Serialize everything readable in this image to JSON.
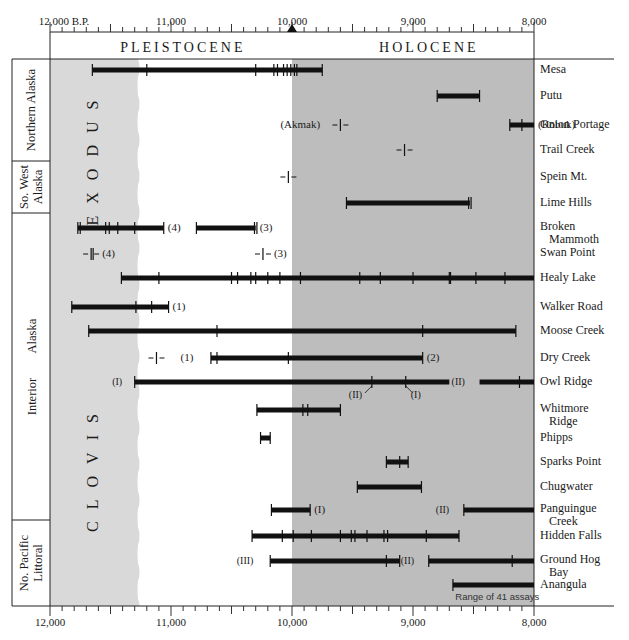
{
  "chart_data": {
    "type": "range-timeline",
    "title": "",
    "x_axis": {
      "label_top_left": "12,000 B.P.",
      "ticks_top": [
        "12,000 B.P.",
        "11,000",
        "10,000",
        "9,000",
        "8,000"
      ],
      "ticks_bottom": [
        "12,000",
        "11,000",
        "10,000",
        "9,000",
        "8,000"
      ],
      "range": [
        12000,
        8000
      ],
      "direction": "decreasing-left-to-right",
      "minor_tick_interval": 100,
      "marker": {
        "value": 10000,
        "symbol": "triangle"
      }
    },
    "epochs": [
      {
        "name": "PLEISTOCENE",
        "from": 12000,
        "to": 10000
      },
      {
        "name": "HOLOCENE",
        "from": 10000,
        "to": 8000
      }
    ],
    "complexes": [
      {
        "name": "EXODUS",
        "zone": "left light-grey band"
      },
      {
        "name": "CLOVIS",
        "zone": "left light-grey band"
      }
    ],
    "regions": [
      {
        "name": "Northern Alaska",
        "sites": [
          "Mesa",
          "Putu",
          "Onion Portage",
          "Trail Creek"
        ]
      },
      {
        "name": "So. West Alaska",
        "sites": [
          "Spein Mt.",
          "Lime Hills"
        ]
      },
      {
        "name": "Interior Alaska",
        "sites": [
          "Broken Mammoth",
          "Swan Point",
          "Healy Lake",
          "Walker Road",
          "Moose Creek",
          "Dry Creek",
          "Owl Ridge",
          "Whitmore Ridge",
          "Phipps",
          "Sparks Point",
          "Chugwater",
          "Panguingue Creek"
        ]
      },
      {
        "name": "No. Pacific Littoral",
        "sites": [
          "Hidden Falls",
          "Ground Hog Bay",
          "Anangula"
        ]
      }
    ],
    "sites": [
      {
        "name": "Mesa",
        "ranges": [
          {
            "from": 11650,
            "to": 9750,
            "dates": [
              11650,
              11200,
              10300,
              10150,
              10120,
              10070,
              10040,
              10010,
              9980,
              9960,
              9750
            ]
          }
        ]
      },
      {
        "name": "Putu",
        "ranges": [
          {
            "from": 8800,
            "to": 8450,
            "dates": [
              8800,
              8450
            ]
          }
        ]
      },
      {
        "name": "Onion Portage",
        "ranges": [
          {
            "from": 8200,
            "to": 8000,
            "label": "(Kobuk)",
            "dates": [
              8200,
              8100
            ]
          }
        ],
        "points": [
          {
            "value": 9600,
            "label": "(Akmak)"
          }
        ]
      },
      {
        "name": "Trail Creek",
        "points": [
          {
            "value": 9070
          }
        ]
      },
      {
        "name": "Spein Mt.",
        "points": [
          {
            "value": 10030
          }
        ]
      },
      {
        "name": "Lime Hills",
        "ranges": [
          {
            "from": 9550,
            "to": 8530,
            "dates": [
              9550,
              8540,
              8520
            ]
          }
        ]
      },
      {
        "name": "Broken Mammoth",
        "ranges": [
          {
            "from": 11770,
            "to": 11060,
            "label": "(4)",
            "dates": [
              11770,
              11750,
              11540,
              11510,
              11440,
              11300,
              11060
            ]
          },
          {
            "from": 10790,
            "to": 10300,
            "label": "(3)",
            "dates": [
              10790,
              10310,
              10290
            ]
          }
        ]
      },
      {
        "name": "Swan Point",
        "points": [
          {
            "value": 11660,
            "label": "(4)",
            "double": true
          },
          {
            "value": 10240,
            "label": "(3)"
          }
        ]
      },
      {
        "name": "Healy Lake",
        "ranges": [
          {
            "from": 11410,
            "to": 8000,
            "dates": [
              11410,
              11100,
              10500,
              10450,
              10340,
              10300,
              10200,
              10100,
              9930,
              9440,
              9270,
              9000,
              8700,
              8690,
              8480,
              8240
            ]
          }
        ]
      },
      {
        "name": "Walker Road",
        "ranges": [
          {
            "from": 11820,
            "to": 11020,
            "label": "(1)",
            "dates": [
              11820,
              11290,
              11160,
              11020
            ]
          }
        ]
      },
      {
        "name": "Moose Creek",
        "ranges": [
          {
            "from": 11680,
            "to": 8150,
            "dates": [
              11680,
              10620,
              8920,
              8150
            ]
          }
        ]
      },
      {
        "name": "Dry Creek",
        "ranges": [
          {
            "from": 10670,
            "to": 8920,
            "label": "(2)",
            "dates": [
              10670,
              10620,
              10030,
              8920
            ]
          }
        ],
        "points": [
          {
            "value": 11120,
            "label": "(1)"
          }
        ]
      },
      {
        "name": "Owl Ridge",
        "ranges": [
          {
            "from": 11300,
            "to": 8700,
            "label_left": "(I)",
            "dates": [
              11300,
              9340,
              9060
            ]
          },
          {
            "from": 8450,
            "to": 8000,
            "label_left": "(II)",
            "dates": [
              8120
            ]
          }
        ],
        "callouts": [
          {
            "value": 9340,
            "label": "(II)"
          },
          {
            "value": 9060,
            "label": "(I)"
          }
        ]
      },
      {
        "name": "Whitmore Ridge",
        "ranges": [
          {
            "from": 10290,
            "to": 9600,
            "dates": [
              10290,
              9910,
              9870,
              9600
            ]
          }
        ]
      },
      {
        "name": "Phipps",
        "ranges": [
          {
            "from": 10260,
            "to": 10180,
            "dates": [
              10260,
              10180
            ]
          }
        ]
      },
      {
        "name": "Sparks Point",
        "ranges": [
          {
            "from": 9220,
            "to": 9040,
            "dates": [
              9220,
              9110,
              9040
            ]
          }
        ]
      },
      {
        "name": "Chugwater",
        "ranges": [
          {
            "from": 9460,
            "to": 8930,
            "dates": [
              9460,
              8930
            ]
          }
        ]
      },
      {
        "name": "Panguingue Creek",
        "ranges": [
          {
            "from": 10170,
            "to": 9850,
            "label": "(I)",
            "dates": [
              10170,
              9850
            ]
          },
          {
            "from": 8580,
            "to": 8000,
            "label_left": "(II)",
            "dates": [
              8580
            ]
          }
        ]
      },
      {
        "name": "Hidden Falls",
        "ranges": [
          {
            "from": 10330,
            "to": 8620,
            "dates": [
              10330,
              10080,
              9990,
              9840,
              9600,
              9510,
              9480,
              9380,
              9240,
              9210,
              8890,
              8620
            ]
          }
        ]
      },
      {
        "name": "Ground Hog Bay",
        "ranges": [
          {
            "from": 10180,
            "to": 9110,
            "label_left": "(III)",
            "dates": [
              10180,
              9220,
              9110
            ]
          },
          {
            "from": 8870,
            "to": 8000,
            "label_left": "(II)",
            "dates": [
              8870,
              8180
            ]
          }
        ]
      },
      {
        "name": "Anangula",
        "ranges": [
          {
            "from": 8670,
            "to": 8000,
            "dates": [
              8670
            ]
          }
        ],
        "note": "Range of 41 assays"
      }
    ],
    "colors": {
      "clovis_exodus_band": "#d9d9d9",
      "holocene_band": "#bdbdbd",
      "bars": "#111111"
    }
  },
  "header": {
    "top_left_label": "12,000 B.P.",
    "pleistocene": "PLEISTOCENE",
    "holocene": "HOLOCENE"
  },
  "labels": {
    "exodus": "EXODUS",
    "clovis": "CLOVIS",
    "anangula_note": "Range of 41 assays"
  }
}
